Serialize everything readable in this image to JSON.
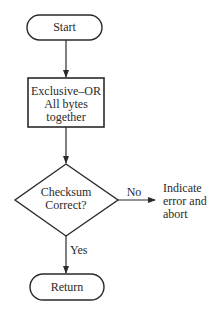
{
  "diagram": {
    "type": "flowchart",
    "nodes": {
      "start": {
        "shape": "terminal",
        "label": "Start"
      },
      "xor": {
        "shape": "process",
        "line1": "Exclusive–OR",
        "line2": "All bytes",
        "line3": "together"
      },
      "check": {
        "shape": "decision",
        "line1": "Checksum",
        "line2": "Correct?"
      },
      "error": {
        "shape": "text",
        "line1": "Indicate",
        "line2": "error and",
        "line3": "abort"
      },
      "return": {
        "shape": "terminal",
        "label": "Return"
      }
    },
    "edges": {
      "no_label": "No",
      "yes_label": "Yes"
    },
    "colors": {
      "stroke": "#2a2a2a",
      "background": "#ffffff"
    }
  }
}
